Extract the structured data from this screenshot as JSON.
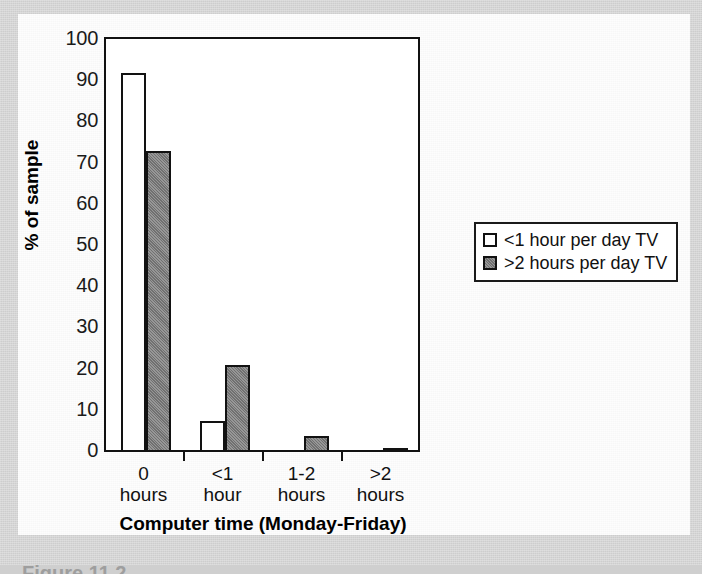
{
  "chart_data": {
    "type": "bar",
    "title": "",
    "xlabel": "Computer time (Monday-Friday)",
    "ylabel": "% of sample",
    "categories": [
      "0 hours",
      "<1 hour",
      "1-2 hours",
      ">2 hours"
    ],
    "category_lines": [
      {
        "line1": "0",
        "line2": "hours"
      },
      {
        "line1": "<1",
        "line2": "hour"
      },
      {
        "line1": "1-2",
        "line2": "hours"
      },
      {
        "line1": ">2",
        "line2": "hours"
      }
    ],
    "series": [
      {
        "name": "<1 hour per day TV",
        "values": [
          92,
          7.5,
          0,
          0
        ],
        "color": "#ffffff"
      },
      {
        "name": ">2 hours per day TV",
        "values": [
          73,
          21,
          4,
          1
        ],
        "color": "#808080"
      }
    ],
    "ylim": [
      0,
      100
    ],
    "yticks": [
      0,
      10,
      20,
      30,
      40,
      50,
      60,
      70,
      80,
      90,
      100
    ],
    "ytick_labels": [
      "0",
      "10",
      "20",
      "30",
      "40",
      "50",
      "60",
      "70",
      "80",
      "90",
      "100"
    ],
    "grid": false,
    "legend_position": "right"
  },
  "legend": {
    "items": [
      {
        "label": "<1 hour per day TV",
        "style": "open"
      },
      {
        "label": ">2 hours per day TV",
        "style": "filled"
      }
    ]
  },
  "caption": {
    "text": "Figure 11.2"
  }
}
